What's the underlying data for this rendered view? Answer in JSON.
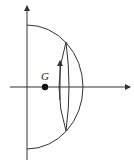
{
  "diagram": {
    "type": "hemisphere-center-of-mass",
    "labels": {
      "center_of_mass": "G"
    },
    "colors": {
      "stroke": "#333333",
      "background": "#ffffff",
      "point": "#111111"
    }
  }
}
